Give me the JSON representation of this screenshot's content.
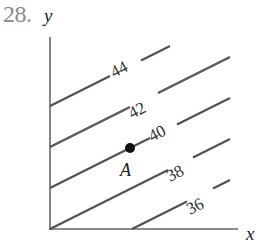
{
  "problem_number": "28.",
  "axes": {
    "x_label": "x",
    "y_label": "y"
  },
  "point": {
    "label": "A",
    "on_level": "40"
  },
  "contours": [
    {
      "level": "44"
    },
    {
      "level": "42"
    },
    {
      "level": "40"
    },
    {
      "level": "38"
    },
    {
      "level": "36"
    }
  ],
  "colors": {
    "line": "#555555",
    "axis": "#666666",
    "point": "#111111",
    "number": "#8a8a8a"
  }
}
